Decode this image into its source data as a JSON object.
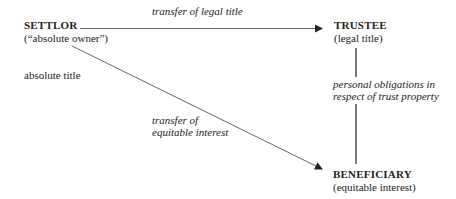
{
  "nodes": {
    "settlor": {
      "title": "SETTLOR",
      "subtitle": "(“absolute owner”)"
    },
    "trustee": {
      "title": "TRUSTEE",
      "subtitle": "(legal title)"
    },
    "beneficiary": {
      "title": "BENEFICIARY",
      "subtitle": "(equitable interest)"
    }
  },
  "edges": {
    "settlor_to_trustee": {
      "label": "transfer of legal title"
    },
    "settlor_to_beneficiary": {
      "label_line1": "transfer of",
      "label_line2": "equitable interest"
    },
    "trustee_to_beneficiary": {
      "label_line1": "personal obligations in",
      "label_line2": "respect of trust property"
    }
  },
  "annotations": {
    "settlor_note": "absolute title"
  },
  "colors": {
    "line": "#555555",
    "text": "#222222"
  }
}
